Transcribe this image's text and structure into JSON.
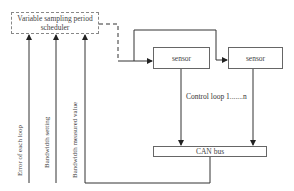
{
  "diagram": {
    "scheduler": {
      "label": "Variable sampling period scheduler",
      "line1": "Variable sampling period",
      "line2": "scheduler",
      "style": "dashed"
    },
    "sensors": [
      {
        "label": "sensor"
      },
      {
        "label": "sensor"
      }
    ],
    "bus": {
      "label": "CAN bus"
    },
    "loop_label": "Control loop 1.......n",
    "inputs": [
      {
        "label": "Error of each loop"
      },
      {
        "label": "Bandwidth setting"
      },
      {
        "label": "Bandwidth measured value"
      }
    ],
    "colors": {
      "line": "#333333",
      "box_border": "#666666",
      "dashed_border": "#888888"
    }
  }
}
